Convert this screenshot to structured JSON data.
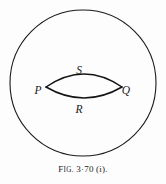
{
  "figure": {
    "caption": {
      "prefix_letter": "F",
      "prefix_rest": "IG.",
      "number": "3·70",
      "part": "(i).",
      "full_text": "FIG. 3·70 (i)."
    },
    "colors": {
      "background": "#fdfdfd",
      "ink": "#1a1a1a",
      "lens_stroke": "#141414",
      "circle_stroke": "#1a1a1a"
    },
    "outer_circle": {
      "name": "outer-circle",
      "cx": 83,
      "cy": 83,
      "r": 73,
      "stroke_width": 1.1,
      "fill": "none"
    },
    "lens": {
      "name": "lens-region",
      "left_point_x": 46,
      "right_point_x": 122,
      "center_y": 87,
      "upper_arc_sag": 13,
      "lower_arc_sag": 11,
      "stroke_width": 1.5
    },
    "labels": [
      {
        "id": "P",
        "text": "P",
        "x": 38,
        "y": 91,
        "role": "vertex-left"
      },
      {
        "id": "Q",
        "text": "Q",
        "x": 126,
        "y": 91,
        "role": "vertex-right"
      },
      {
        "id": "S",
        "text": "S",
        "x": 79,
        "y": 71,
        "role": "arc-upper"
      },
      {
        "id": "R",
        "text": "R",
        "x": 79,
        "y": 110,
        "role": "arc-lower"
      }
    ]
  }
}
